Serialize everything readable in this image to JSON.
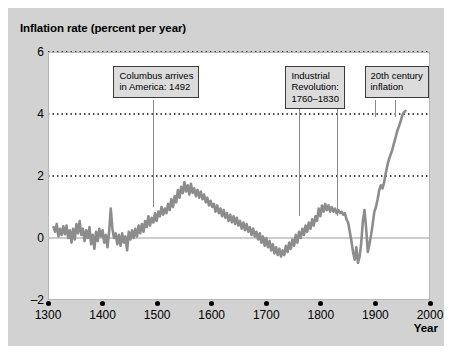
{
  "figure": {
    "background_color": "#d2d2d2",
    "plot_background_color": "#ffffff",
    "series_color": "#8c8c8c",
    "gridline_color": "#000000",
    "annotation_box_color": "#dcdcdc"
  },
  "chart_data": {
    "type": "line",
    "title": "",
    "ylabel": "Inflation rate (percent per year)",
    "xlabel": "Year",
    "xlim": [
      1300,
      2000
    ],
    "ylim": [
      -2,
      6
    ],
    "xticks": [
      1300,
      1400,
      1500,
      1600,
      1700,
      1800,
      1900,
      2000
    ],
    "xtick_labels": [
      "1300",
      "1400",
      "1500",
      "1600",
      "1700",
      "1800",
      "1900",
      "2000"
    ],
    "yticks": [
      -2,
      0,
      2,
      4,
      6
    ],
    "ytick_labels": [
      "-2",
      "0",
      "2",
      "4",
      "6"
    ],
    "grid": "horizontal dotted at y = 2, 4, 6; solid zero line at y = 0",
    "legend": "none",
    "series": [
      {
        "name": "Inflation rate",
        "x": [
          1310,
          1313,
          1316,
          1319,
          1322,
          1325,
          1328,
          1331,
          1334,
          1337,
          1340,
          1343,
          1346,
          1349,
          1352,
          1355,
          1358,
          1361,
          1364,
          1367,
          1370,
          1373,
          1376,
          1379,
          1382,
          1385,
          1388,
          1391,
          1394,
          1397,
          1400,
          1403,
          1406,
          1409,
          1412,
          1415,
          1418,
          1421,
          1424,
          1427,
          1430,
          1433,
          1436,
          1439,
          1442,
          1445,
          1448,
          1451,
          1454,
          1457,
          1460,
          1463,
          1466,
          1469,
          1472,
          1475,
          1478,
          1481,
          1484,
          1487,
          1490,
          1493,
          1496,
          1499,
          1502,
          1505,
          1508,
          1511,
          1514,
          1517,
          1520,
          1523,
          1526,
          1529,
          1532,
          1535,
          1538,
          1541,
          1544,
          1547,
          1550,
          1553,
          1556,
          1559,
          1562,
          1565,
          1568,
          1571,
          1574,
          1577,
          1580,
          1583,
          1586,
          1589,
          1592,
          1595,
          1598,
          1601,
          1604,
          1607,
          1610,
          1613,
          1616,
          1619,
          1622,
          1625,
          1628,
          1631,
          1634,
          1637,
          1640,
          1643,
          1646,
          1649,
          1652,
          1655,
          1658,
          1661,
          1664,
          1667,
          1670,
          1673,
          1676,
          1679,
          1682,
          1685,
          1688,
          1691,
          1694,
          1697,
          1700,
          1703,
          1706,
          1709,
          1712,
          1715,
          1718,
          1721,
          1724,
          1727,
          1730,
          1733,
          1736,
          1739,
          1742,
          1745,
          1748,
          1751,
          1754,
          1757,
          1760,
          1763,
          1766,
          1769,
          1772,
          1775,
          1778,
          1781,
          1784,
          1787,
          1790,
          1793,
          1796,
          1799,
          1802,
          1805,
          1808,
          1811,
          1814,
          1817,
          1820,
          1823,
          1826,
          1829,
          1832,
          1835,
          1838,
          1841,
          1844,
          1847,
          1850,
          1853,
          1856,
          1859,
          1862,
          1865,
          1868,
          1871,
          1874,
          1877,
          1880,
          1883,
          1886,
          1889,
          1892,
          1895,
          1898,
          1901,
          1904,
          1907,
          1910,
          1913,
          1916,
          1919,
          1922,
          1925,
          1928,
          1931,
          1934,
          1937,
          1940,
          1943,
          1946,
          1949,
          1952,
          1955
        ],
        "y": [
          0.35,
          0.2,
          0.45,
          0.05,
          0.3,
          0.1,
          0.38,
          0.12,
          0.4,
          0.0,
          0.25,
          -0.15,
          0.3,
          -0.05,
          0.45,
          0.15,
          0.55,
          0.1,
          0.3,
          -0.1,
          0.25,
          0.0,
          0.35,
          -0.2,
          0.1,
          -0.35,
          0.2,
          -0.1,
          0.3,
          0.05,
          0.25,
          -0.15,
          0.1,
          -0.3,
          0.2,
          0.95,
          0.3,
          0.0,
          0.15,
          -0.2,
          0.1,
          -0.25,
          0.15,
          -0.15,
          0.05,
          -0.4,
          0.2,
          -0.05,
          0.25,
          0.0,
          0.3,
          0.05,
          0.4,
          0.15,
          0.45,
          0.2,
          0.55,
          0.35,
          0.7,
          0.4,
          0.65,
          0.5,
          0.8,
          0.55,
          0.85,
          0.7,
          1.0,
          0.75,
          0.95,
          0.8,
          1.1,
          0.9,
          1.25,
          1.0,
          1.35,
          1.15,
          1.55,
          1.3,
          1.65,
          1.45,
          1.8,
          1.5,
          1.7,
          1.4,
          1.75,
          1.45,
          1.6,
          1.35,
          1.55,
          1.3,
          1.5,
          1.25,
          1.4,
          1.15,
          1.3,
          1.05,
          1.2,
          1.0,
          1.1,
          0.85,
          1.05,
          0.8,
          0.95,
          0.7,
          0.9,
          0.65,
          0.8,
          0.55,
          0.75,
          0.5,
          0.7,
          0.45,
          0.65,
          0.4,
          0.55,
          0.3,
          0.5,
          0.25,
          0.45,
          0.2,
          0.35,
          0.1,
          0.3,
          0.05,
          0.2,
          -0.05,
          0.15,
          -0.15,
          0.05,
          -0.25,
          0.0,
          -0.3,
          -0.1,
          -0.4,
          -0.2,
          -0.5,
          -0.3,
          -0.55,
          -0.35,
          -0.6,
          -0.4,
          -0.55,
          -0.25,
          -0.45,
          -0.15,
          -0.35,
          -0.05,
          -0.25,
          0.1,
          -0.15,
          0.2,
          0.0,
          0.3,
          0.1,
          0.4,
          0.2,
          0.5,
          0.3,
          0.6,
          0.4,
          0.7,
          0.55,
          0.95,
          0.7,
          1.05,
          0.85,
          1.1,
          0.9,
          1.05,
          0.85,
          1.0,
          0.85,
          0.95,
          0.8,
          0.9,
          0.8,
          0.85,
          0.75,
          0.8,
          0.6,
          0.5,
          0.2,
          -0.1,
          -0.45,
          -0.7,
          -0.3,
          -0.8,
          -0.6,
          -0.15,
          0.55,
          0.9,
          0.3,
          -0.45,
          -0.2,
          0.1,
          0.45,
          0.85,
          1.0,
          1.25,
          1.55,
          1.7,
          1.6,
          1.8,
          2.1,
          2.35,
          2.55,
          2.7,
          2.85,
          3.05,
          3.25,
          3.45,
          3.6,
          3.75,
          3.95,
          4.05,
          4.1
        ],
        "note": "Approximate UK/long-run inflation rate reconstruction, noisy series drawn in gray"
      }
    ],
    "annotations": [
      {
        "id": "columbus",
        "lines": [
          "Columbus arrives",
          "in America: 1492"
        ],
        "box_x": 1420,
        "box_y_top": 5.55,
        "leader_x": [
          1492
        ],
        "leader_to_y": 1.0
      },
      {
        "id": "industrial-revolution",
        "lines": [
          "Industrial",
          "Revolution:",
          "1760–1830"
        ],
        "box_x": 1735,
        "box_y_top": 5.55,
        "leader_x": [
          1760,
          1830
        ],
        "leader_to_y": 0.7
      },
      {
        "id": "20th-century-inflation",
        "lines": [
          "20th century",
          "inflation"
        ],
        "box_x": 1880,
        "box_y_top": 5.55,
        "leader_x": [
          1900,
          1935
        ],
        "leader_to_y": 3.9
      }
    ]
  }
}
